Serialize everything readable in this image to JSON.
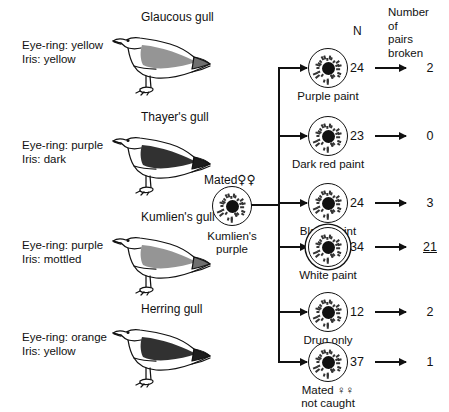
{
  "species": [
    {
      "name": "Glaucous gull",
      "eye_ring": "Eye-ring: yellow",
      "iris": "Iris: yellow",
      "back_shade": "light"
    },
    {
      "name": "Thayer's gull",
      "eye_ring": "Eye-ring: purple",
      "iris": "Iris: dark",
      "back_shade": "dark"
    },
    {
      "name": "Kumlien's gull",
      "eye_ring": "Eye-ring: purple",
      "iris": "Iris: mottled",
      "back_shade": "light"
    },
    {
      "name": "Herring gull",
      "eye_ring": "Eye-ring: orange",
      "iris": "Iris: yellow",
      "back_shade": "dark"
    }
  ],
  "source_node": {
    "mated_caption": "Mated",
    "mated_symbols": "♀♀",
    "label_line1": "Kumlien's",
    "label_line2": "purple"
  },
  "columns": {
    "n_header": "N",
    "broken_header_lines": [
      "Number",
      "of",
      "pairs",
      "broken"
    ]
  },
  "chart_data": {
    "type": "table",
    "columns": [
      "Treatment",
      "N",
      "Number of pairs broken"
    ],
    "rows": [
      {
        "treatment": "Purple paint",
        "n": 24,
        "broken": 2,
        "highlight": false,
        "double_ring": false
      },
      {
        "treatment": "Dark red paint",
        "n": 23,
        "broken": 0,
        "highlight": false,
        "double_ring": false
      },
      {
        "treatment": "Black paint",
        "n": 24,
        "broken": 3,
        "highlight": false,
        "double_ring": false
      },
      {
        "treatment": "White paint",
        "n": 34,
        "broken": 21,
        "highlight": true,
        "double_ring": true
      },
      {
        "treatment": "Drug only",
        "n": 12,
        "broken": 2,
        "highlight": false,
        "double_ring": false
      },
      {
        "treatment": "Mated ♀♀ not caught",
        "n": 37,
        "broken": 1,
        "highlight": false,
        "double_ring": false
      }
    ]
  },
  "branches": [
    {
      "label_line1": "Purple paint",
      "label_line2": "",
      "n": "24",
      "broken": "2",
      "underline": false,
      "double_ring": false
    },
    {
      "label_line1": "Dark red paint",
      "label_line2": "",
      "n": "23",
      "broken": "0",
      "underline": false,
      "double_ring": false
    },
    {
      "label_line1": "Black paint",
      "label_line2": "",
      "n": "24",
      "broken": "3",
      "underline": false,
      "double_ring": false
    },
    {
      "label_line1": "White paint",
      "label_line2": "",
      "n": "34",
      "broken": "21",
      "underline": true,
      "double_ring": true
    },
    {
      "label_line1": "Drug only",
      "label_line2": "",
      "n": "12",
      "broken": "2",
      "underline": false,
      "double_ring": false
    },
    {
      "label_line1": "Mated ♀♀",
      "label_line2": "not caught",
      "n": "37",
      "broken": "1",
      "underline": false,
      "double_ring": false
    }
  ]
}
